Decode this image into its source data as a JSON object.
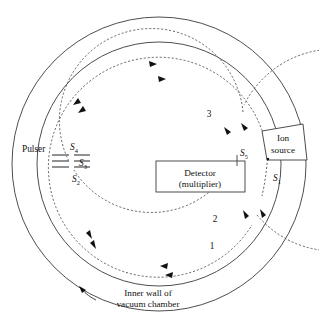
{
  "figure": {
    "kind": "multi-pass-time-of-flight-analyzer-schematic",
    "components": {
      "ion_source_label_line1": "Ion",
      "ion_source_label_line2": "source",
      "pulser_label": "Pulser",
      "detector_label_line1": "Detector",
      "detector_label_line2": "(multiplier)",
      "wall_caption_line1": "Inner wall of",
      "wall_caption_line2": "vacuum chamber"
    },
    "slit_labels": [
      {
        "name": "S1",
        "base": "S",
        "sub": "1"
      },
      {
        "name": "S2",
        "base": "S",
        "sub": "2"
      },
      {
        "name": "S3",
        "base": "S",
        "sub": "3"
      },
      {
        "name": "S4",
        "base": "S",
        "sub": "4"
      },
      {
        "name": "S5",
        "base": "S",
        "sub": "5"
      }
    ],
    "pass_numbers": [
      "1",
      "2",
      "3"
    ],
    "colors": {
      "outline": "#3a3a3a",
      "trajectory": "#4a4a4a",
      "text": "#111111",
      "electrode": "#6e6e6e",
      "background": "#ffffff"
    }
  }
}
